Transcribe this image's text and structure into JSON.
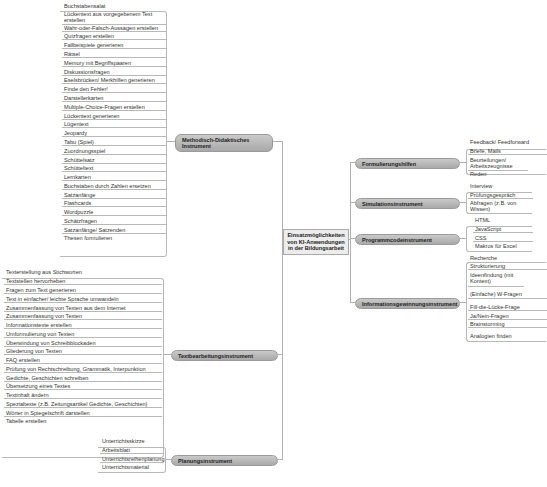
{
  "center": {
    "label_lines": [
      "Einsatzmöglichkeiten",
      "von KI-Anwendungen",
      "in der Bildungsarbeit"
    ]
  },
  "branches": {
    "methodisch": {
      "label_lines": [
        "Methodisch-Didaktisches",
        "Instrument"
      ]
    },
    "textbearbeitung": {
      "label": "Textbearbeitungsinstrument"
    },
    "planung": {
      "label": "Planungsinstrument"
    },
    "formulierung": {
      "label": "Formulierungshilfen"
    },
    "simulation": {
      "label": "Simulationsinstrument"
    },
    "programmcode": {
      "label": "Programmcodeinstrument"
    },
    "information": {
      "label": "Informationsgewinnungsinstrument"
    }
  },
  "leaves": {
    "methodisch": [
      "Buchstabensalat",
      "Lückentext aus vorgegebenem Text erstellen",
      "Wahr-oder-Falsch-Aussagen erstellen",
      "Quizfragen erstellen",
      "Fallbeispiele generieren",
      "Rätsel",
      "Memory mit Begriffspaaren",
      "Diskussionsfragen",
      "Eselsbrücken/ Merkhilfen generieren",
      "Finde den Fehler!",
      "Darstellerkarten",
      "Multiple-Choice-Fragen erstellen",
      "Lückentext generieren",
      "Lügentext",
      "Jeopardy",
      "Tabu (Spiel)",
      "Zuordnungsspiel",
      "Schüttelsatz",
      "Schütteltext",
      "Lernkarten",
      "Buchstaben durch Zahlen ersetzen",
      "Satzanfänge",
      "Flashcards",
      "Wordpuzzle",
      "Schätzfragen",
      "Satzanfänge/ Satzenden",
      "Thesen formulieren"
    ],
    "textbearbeitung": [
      "Texterstellung aus Stichworten",
      "Textstellen hervorheben",
      "Fragen zum Text generieren",
      "Text in einfacher/ leichte Sprache umwandeln",
      "Zusammenfassung von Texten aus dem Internet",
      "Zusammenfassung von Texten",
      "Informationstexte erstellen",
      "Umformulierung von Texten",
      "Überwindung von Schreibblockaden",
      "Gliederung von Texten",
      "FAQ erstellen",
      "Prüfung von Rechtschreibung, Grammatik, Interpunktion",
      "Gedichte, Geschichten schreiben",
      "Übersetzung eines Textes",
      "Textinhalt ändern",
      "Spezialtexte (z.B. Zeitungsartikel Gedichte, Geschichten)",
      "Wörter in Spiegelschrift darstellen",
      "Tabelle erstellen"
    ],
    "planung": [
      "Unterrichtsskizze",
      "Arbeitsblatt",
      "Unterrichtsreihenplanung",
      "Unterrichtsmaterial"
    ],
    "formulierung": [
      "Feedback/ Feedforward",
      "Briefe, Mails",
      "Beurteilungen/ Arbeitszeugnisse",
      "Reden"
    ],
    "simulation": [
      "Interview",
      "Prüfungsgespräch",
      "Abfragen (z.B. von Wissen)"
    ],
    "programmcode": [
      "HTML",
      "JavaScript",
      "CSS",
      "Makros für Excel"
    ],
    "information": [
      "Recherche",
      "Strukturierung",
      "Ideenfindung (mit Kontext)",
      "(Einfache) W-Fragen",
      "Fill-die-Lücke-Frage",
      "Ja/Nein-Fragen",
      "Brainstorming",
      "Analogien finden"
    ]
  },
  "colors": {
    "branch_fill": "#b9b9b9",
    "center_fill": "#ececec",
    "line": "#b0b0b0"
  }
}
